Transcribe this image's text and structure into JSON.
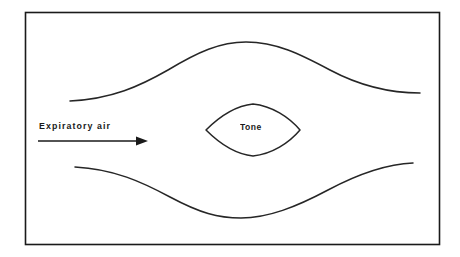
{
  "figure": {
    "kind": "anatomical-schematic",
    "background_color": "#ffffff",
    "stroke_color": "#262626",
    "frame_color": "#1a1a1a"
  },
  "labels": {
    "expiratory_air": "Expiratory air",
    "tone": "Tone"
  },
  "frame": {
    "x": 25,
    "y": 12,
    "width": 415,
    "height": 233
  },
  "arrow": {
    "name": "expiratory-air-arrow",
    "x_start": 38,
    "x_end": 148,
    "y": 141,
    "direction": "right",
    "head_length": 11,
    "head_half_width": 4
  },
  "shapes": {
    "upper_wall": {
      "name": "upper-vocal-tract-wall",
      "start": [
        70,
        101
      ],
      "peak": [
        245,
        42
      ],
      "end": [
        420,
        93
      ]
    },
    "lower_wall": {
      "name": "lower-vocal-tract-wall",
      "start": [
        75,
        167
      ],
      "trough": [
        240,
        218
      ],
      "end": [
        413,
        163
      ]
    },
    "glottis": {
      "name": "glottis-lens",
      "left_tip": [
        206,
        130
      ],
      "right_tip": [
        300,
        130
      ],
      "top_apex": [
        253,
        104
      ],
      "bottom_apex": [
        253,
        155
      ]
    }
  }
}
